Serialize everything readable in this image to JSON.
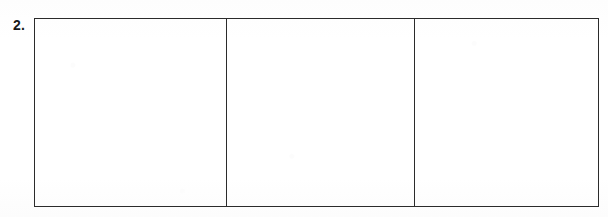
{
  "page": {
    "background_color": "#ffffff",
    "width": 608,
    "height": 217
  },
  "worksheet_item": {
    "number_label": "2.",
    "prompt_text": "",
    "grid": {
      "border_color": "#2b2b2b",
      "fill_color": "#ffffff",
      "column_count": 3,
      "row_count": 1,
      "cells": [
        {
          "id": "cell-1",
          "value": "",
          "placeholder": ""
        },
        {
          "id": "cell-2",
          "value": "",
          "placeholder": ""
        },
        {
          "id": "cell-3",
          "value": "",
          "placeholder": ""
        }
      ]
    }
  }
}
